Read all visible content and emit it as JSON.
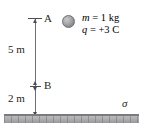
{
  "figure": {
    "points": {
      "a": {
        "label": "A"
      },
      "b": {
        "label": "B"
      }
    },
    "dimensions": [
      {
        "name": "a-to-b",
        "label": "5 m",
        "value": 5,
        "unit": "m"
      },
      {
        "name": "b-to-ground",
        "label": "2 m",
        "value": 2,
        "unit": "m"
      }
    ],
    "particle": {
      "mass_label": "m = 1 kg",
      "mass_symbol": "m",
      "mass_equals": " = 1 kg",
      "charge_label": "q = +3 C",
      "charge_symbol": "q",
      "charge_equals": " = +3 C",
      "mass_value": 1,
      "mass_unit": "kg",
      "charge_value": 3,
      "charge_unit": "C",
      "icon": "sphere-icon"
    },
    "surface": {
      "label": "σ",
      "name": "surface-charge-density"
    },
    "colors": {
      "ink": "#231f20",
      "line": "#6d6e71",
      "arrow": "#4d4d4f",
      "ground_top": "#7b7b7e",
      "ground_body": "#a9a9ac",
      "sphere": "#a8a8ab"
    }
  }
}
